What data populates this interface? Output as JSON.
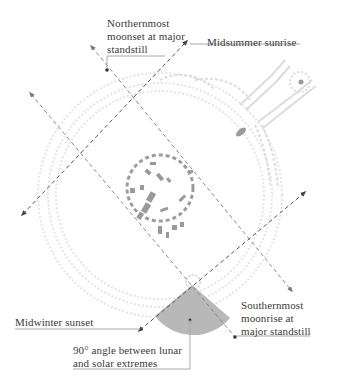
{
  "diagram": {
    "labels": {
      "northern_moonset": [
        "Northernmost",
        "moonset at major",
        "standstill"
      ],
      "midsummer_sunrise": "Midsummer sunrise",
      "midwinter_sunset": "Midwinter sunset",
      "southern_moonrise": [
        "Southernmost",
        "moonrise at",
        "major standstill"
      ],
      "right_angle": [
        "90° angle between lunar",
        "and solar extremes"
      ]
    },
    "alignments": [
      {
        "name": "lunar-axis-1",
        "from": "Northernmost moonset at major standstill",
        "to": "Southernmost moonrise at major standstill",
        "style": "dashed"
      },
      {
        "name": "lunar-axis-2",
        "from": "Northernmost moonset at major standstill",
        "to": "Southernmost moonrise at major standstill",
        "style": "dashed"
      },
      {
        "name": "solar-axis-1",
        "from": "Midwinter sunset",
        "to": "Midsummer sunrise",
        "style": "dashed"
      },
      {
        "name": "solar-axis-2",
        "from": "Midwinter sunset",
        "to": "Midsummer sunrise",
        "style": "dashed"
      }
    ],
    "angle_marker": {
      "degrees": 90,
      "fill": "#b8b8b8"
    },
    "colors": {
      "line": "#6e6e6e",
      "stones": "#9a9a9a",
      "earthworks": "#e2e2e2",
      "text": "#3a3a3a"
    }
  }
}
